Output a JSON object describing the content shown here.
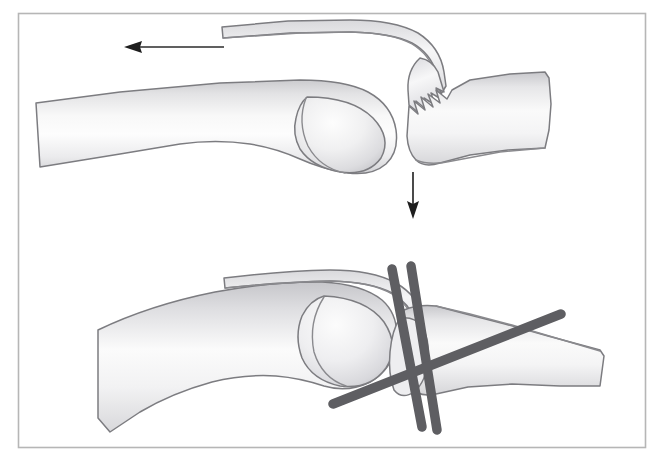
{
  "figure": {
    "alt_top": "Top panel: dorsal avulsion fragment of the distal phalanx base retracted proximally by the extensor tendon, with the distal phalanx subluxating volarly",
    "alt_bottom": "Bottom panel: reduction held by two parallel longitudinal Kirschner wires and one oblique transfixing Kirschner wire",
    "panels": [
      {
        "id": "panel-injury",
        "label": "Injury pattern",
        "elements": [
          {
            "name": "proximal-phalanx",
            "label": "Proximal phalanx"
          },
          {
            "name": "condyle-head",
            "label": "Condylar head"
          },
          {
            "name": "avulsed-dorsal-fragment",
            "label": "Avulsed dorsal fragment with extensor tendon"
          },
          {
            "name": "distal-phalanx",
            "label": "Distal phalanx"
          },
          {
            "name": "fracture-line",
            "label": "Comminuted fracture margin"
          }
        ],
        "arrows": [
          {
            "name": "tendon-retraction-arrow",
            "direction": "left",
            "label": "Proximal pull of extensor tendon"
          },
          {
            "name": "volar-subluxation-arrow",
            "direction": "down",
            "label": "Volar subluxation of distal phalanx"
          }
        ]
      },
      {
        "id": "panel-fixation",
        "label": "K-wire fixation",
        "elements": [
          {
            "name": "proximal-phalanx",
            "label": "Proximal phalanx"
          },
          {
            "name": "condyle-head",
            "label": "Condylar head"
          },
          {
            "name": "reduced-dorsal-fragment",
            "label": "Reduced dorsal fragment"
          },
          {
            "name": "distal-phalanx",
            "label": "Distal phalanx"
          }
        ],
        "wires": [
          {
            "name": "kwire-longitudinal-1",
            "label": "Longitudinal K-wire 1",
            "orientation": "near-vertical"
          },
          {
            "name": "kwire-longitudinal-2",
            "label": "Longitudinal K-wire 2",
            "orientation": "near-vertical"
          },
          {
            "name": "kwire-oblique",
            "label": "Oblique transfixing K-wire",
            "orientation": "oblique"
          }
        ]
      }
    ]
  },
  "colors": {
    "background": "#ffffff",
    "frame_border": "#b6b6b6",
    "bone_outline": "#7c7c80",
    "bone_fill_light": "#fdfdfd",
    "bone_fill_mid": "#e9e9ea",
    "bone_fill_shadow": "#c9c9cc",
    "kwire": "#5e5e62",
    "arrow": "#1e1e1e"
  }
}
